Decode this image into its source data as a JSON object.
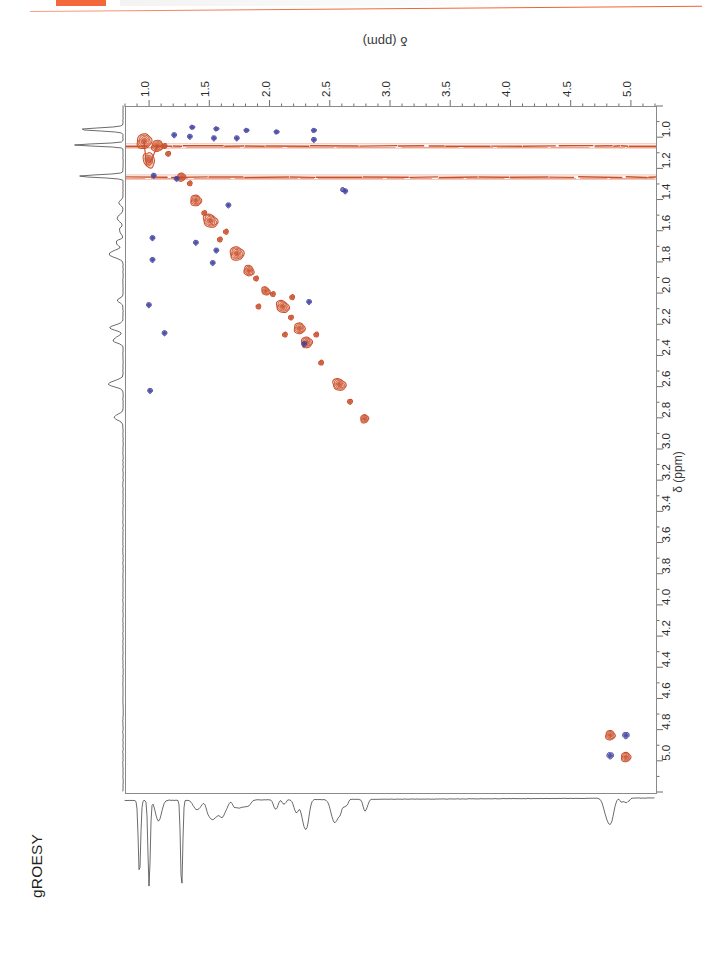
{
  "document": {
    "experiment_label": "gROESY",
    "header_accent_color": "#f4693c",
    "header_rule_color": "#ef6136"
  },
  "spectrum": {
    "type": "2D NMR contour (ROESY)",
    "positive_contour_color": "#c8502c",
    "positive_contour_fill": "#e4724b",
    "negative_contour_color": "#3f3f9e",
    "negative_contour_fill": "#5a5abe",
    "frame_color": "#8a8a8a"
  },
  "axes": {
    "top": {
      "label": "δ (ppm)",
      "direction": "left-to-right increasing",
      "min": 0.8,
      "max": 5.2,
      "major_step": 0.5,
      "minor_step": 0.1,
      "tick_labels": [
        "1.0",
        "1.5",
        "2.0",
        "2.5",
        "3.0",
        "3.5",
        "4.0",
        "4.5",
        "5.0"
      ],
      "tick_values": [
        1.0,
        1.5,
        2.0,
        2.5,
        3.0,
        3.5,
        4.0,
        4.5,
        5.0
      ]
    },
    "right": {
      "label": "δ (ppm)",
      "direction": "top-to-bottom increasing",
      "min": 0.8,
      "max": 5.2,
      "major_step": 0.2,
      "minor_step": 0.1,
      "tick_labels": [
        "1.0",
        "1.2",
        "1.4",
        "1.6",
        "1.8",
        "2.0",
        "2.2",
        "2.4",
        "2.6",
        "2.8",
        "3.0",
        "3.2",
        "3.4",
        "3.6",
        "3.8",
        "4.0",
        "4.2",
        "4.4",
        "4.6",
        "4.8",
        "5.0"
      ],
      "tick_values": [
        1.0,
        1.2,
        1.4,
        1.6,
        1.8,
        2.0,
        2.2,
        2.4,
        2.6,
        2.8,
        3.0,
        3.2,
        3.4,
        3.6,
        3.8,
        4.0,
        4.2,
        4.4,
        4.6,
        4.8,
        5.0
      ]
    }
  },
  "chart_data": {
    "type": "heatmap",
    "title": "gROESY",
    "xlabel": "δ (ppm)",
    "ylabel": "δ (ppm)",
    "xlim": [
      0.8,
      5.2
    ],
    "ylim": [
      0.8,
      5.2
    ],
    "grid": false,
    "legend": "none",
    "notes": [
      "Symmetric 2D homonuclear correlation map; positive (orange) diagonal peaks with blue negative cross peaks.",
      "Two intense horizontal t1-noise ridges at δ ~1.05 and ~1.25 ppm."
    ],
    "diagonal_peaks": [
      {
        "x": 0.95,
        "y": 1.02,
        "w": 0.13,
        "h": 0.09,
        "sign": "positive"
      },
      {
        "x": 1.06,
        "y": 1.05,
        "w": 0.1,
        "h": 0.07,
        "sign": "positive"
      },
      {
        "x": 1.26,
        "y": 1.25,
        "w": 0.07,
        "h": 0.05,
        "sign": "positive"
      },
      {
        "x": 1.38,
        "y": 1.4,
        "w": 0.09,
        "h": 0.07,
        "sign": "positive"
      },
      {
        "x": 1.5,
        "y": 1.53,
        "w": 0.1,
        "h": 0.1,
        "sign": "positive"
      },
      {
        "x": 1.72,
        "y": 1.74,
        "w": 0.11,
        "h": 0.09,
        "sign": "positive"
      },
      {
        "x": 1.82,
        "y": 1.85,
        "w": 0.08,
        "h": 0.07,
        "sign": "positive"
      },
      {
        "x": 1.96,
        "y": 1.98,
        "w": 0.06,
        "h": 0.06,
        "sign": "positive"
      },
      {
        "x": 2.1,
        "y": 2.08,
        "w": 0.09,
        "h": 0.09,
        "sign": "positive"
      },
      {
        "x": 2.24,
        "y": 2.22,
        "w": 0.09,
        "h": 0.07,
        "sign": "positive"
      },
      {
        "x": 2.3,
        "y": 2.31,
        "w": 0.09,
        "h": 0.07,
        "sign": "positive"
      },
      {
        "x": 2.57,
        "y": 2.58,
        "w": 0.09,
        "h": 0.09,
        "sign": "positive"
      },
      {
        "x": 2.78,
        "y": 2.8,
        "w": 0.07,
        "h": 0.05,
        "sign": "positive"
      },
      {
        "x": 4.82,
        "y": 4.83,
        "w": 0.08,
        "h": 0.06,
        "sign": "positive"
      },
      {
        "x": 4.95,
        "y": 4.97,
        "w": 0.08,
        "h": 0.06,
        "sign": "positive"
      }
    ],
    "cross_peaks": [
      {
        "x": 2.36,
        "y": 1.01,
        "sign": "negative"
      },
      {
        "x": 1.2,
        "y": 0.98,
        "sign": "negative"
      },
      {
        "x": 1.33,
        "y": 0.99,
        "sign": "negative"
      },
      {
        "x": 1.53,
        "y": 1.0,
        "sign": "negative"
      },
      {
        "x": 1.72,
        "y": 1.0,
        "sign": "negative"
      },
      {
        "x": 1.03,
        "y": 1.24,
        "sign": "negative"
      },
      {
        "x": 1.22,
        "y": 1.26,
        "sign": "negative"
      },
      {
        "x": 2.62,
        "y": 1.34,
        "sign": "negative"
      },
      {
        "x": 1.65,
        "y": 1.43,
        "sign": "negative"
      },
      {
        "x": 1.02,
        "y": 1.64,
        "sign": "negative"
      },
      {
        "x": 1.02,
        "y": 1.78,
        "sign": "negative"
      },
      {
        "x": 1.38,
        "y": 1.67,
        "sign": "negative"
      },
      {
        "x": 1.55,
        "y": 1.72,
        "sign": "negative"
      },
      {
        "x": 1.52,
        "y": 1.8,
        "sign": "negative"
      },
      {
        "x": 0.99,
        "y": 2.07,
        "sign": "negative"
      },
      {
        "x": 2.32,
        "y": 2.05,
        "sign": "negative"
      },
      {
        "x": 1.12,
        "y": 2.25,
        "sign": "negative"
      },
      {
        "x": 2.28,
        "y": 2.32,
        "sign": "negative"
      },
      {
        "x": 1.0,
        "y": 2.62,
        "sign": "negative"
      },
      {
        "x": 4.95,
        "y": 4.83,
        "sign": "negative"
      },
      {
        "x": 4.82,
        "y": 4.96,
        "sign": "negative"
      }
    ],
    "noise_ridges": [
      {
        "axis": "horizontal",
        "ppm": 1.05,
        "sign": "positive"
      },
      {
        "axis": "horizontal",
        "ppm": 1.25,
        "sign": "positive"
      }
    ],
    "projection_top_peaks_ppm": [
      0.92,
      1.0,
      1.08,
      1.27,
      1.4,
      1.5,
      1.56,
      1.62,
      1.72,
      1.8,
      2.05,
      2.12,
      2.22,
      2.3,
      2.55,
      2.62,
      2.8,
      4.82,
      4.95
    ],
    "projection_left_peaks_ppm": [
      0.95,
      1.05,
      1.25,
      1.42,
      1.52,
      1.6,
      1.68,
      1.75,
      2.05,
      2.22,
      2.3,
      2.58,
      2.8
    ]
  }
}
